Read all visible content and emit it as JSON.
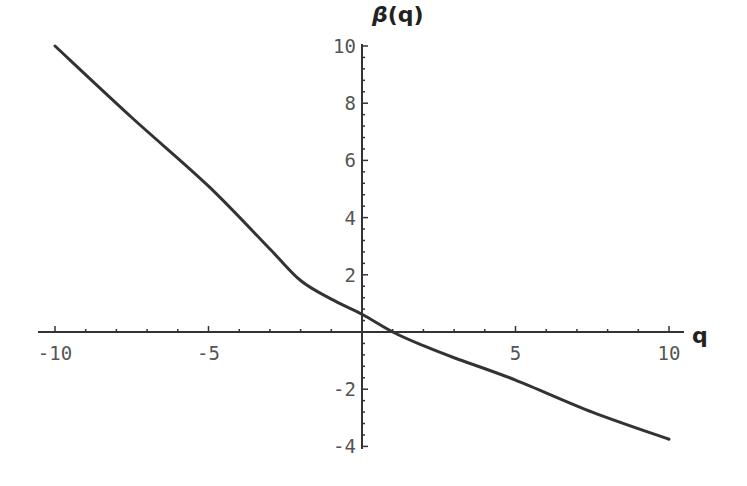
{
  "chart_data": {
    "type": "line",
    "title": "",
    "xlabel": "q",
    "ylabel": "β(q)",
    "xlim": [
      -10,
      10
    ],
    "ylim": [
      -4,
      10
    ],
    "grid": false,
    "legend": null,
    "x_ticks": [
      -10,
      -5,
      5,
      10
    ],
    "x_tick_labels": [
      "-10",
      "-5",
      "5",
      "10"
    ],
    "y_ticks": [
      -4,
      -2,
      2,
      4,
      6,
      8,
      10
    ],
    "y_tick_labels": [
      "-4",
      "-2",
      "2",
      "4",
      "6",
      "8",
      "10"
    ],
    "series": [
      {
        "name": "β(q)",
        "color": "#333333",
        "x": [
          -10,
          -7.5,
          -5,
          -3,
          -2,
          -1,
          0,
          1,
          2,
          3,
          5,
          7.5,
          10
        ],
        "y": [
          10.0,
          7.5,
          5.1,
          2.9,
          1.8,
          1.15,
          0.62,
          0.0,
          -0.48,
          -0.9,
          -1.68,
          -2.8,
          -3.75
        ]
      }
    ]
  },
  "labels": {
    "x_axis": "q",
    "y_axis_beta": "β",
    "y_axis_arg": "(q)"
  }
}
